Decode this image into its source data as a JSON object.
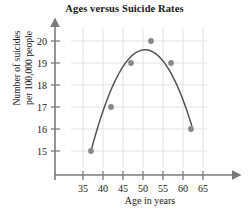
{
  "chart_data": {
    "type": "scatter",
    "title": "Ages versus Suicide Rates",
    "xlabel": "Age in years",
    "ylabel_line1": "Number of suicides",
    "ylabel_line2": "per 100,000 people",
    "ylabel": "Number of suicides per 100,000 people",
    "x": [
      37,
      42,
      47,
      52,
      57,
      62
    ],
    "values": [
      15,
      17,
      19,
      20,
      19,
      16
    ],
    "points": [
      {
        "x": 37,
        "y": 15
      },
      {
        "x": 42,
        "y": 17
      },
      {
        "x": 47,
        "y": 19
      },
      {
        "x": 52,
        "y": 20
      },
      {
        "x": 57,
        "y": 19
      },
      {
        "x": 62,
        "y": 16
      }
    ],
    "xticks": [
      35,
      40,
      45,
      50,
      55,
      60,
      65
    ],
    "yticks": [
      15,
      16,
      17,
      18,
      19,
      20
    ],
    "xlim": [
      32,
      66
    ],
    "ylim": [
      14.2,
      20.6
    ],
    "grid": true,
    "legend": "none",
    "fit_curve": {
      "type": "quadratic",
      "vertex_x": 50.5,
      "vertex_y": 19.6,
      "x_start": 37,
      "x_end": 62.2
    },
    "colors": {
      "point": "#8a8a8a",
      "curve": "#555555",
      "axis": "#7a7a7a",
      "grid": "#e3e3e3",
      "text": "#1a1a1a"
    }
  }
}
